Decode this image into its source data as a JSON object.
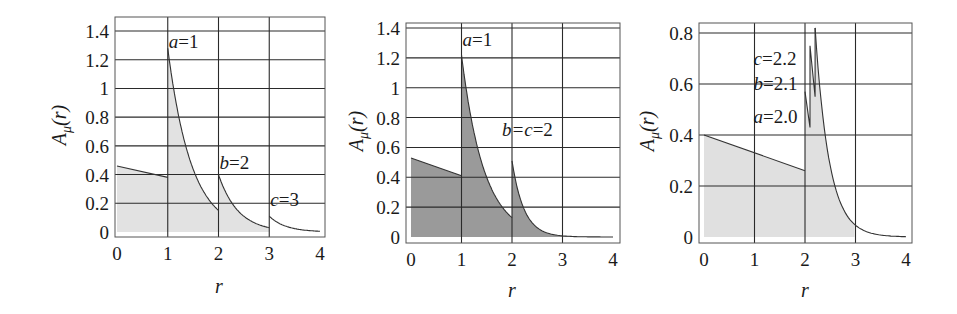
{
  "chart_data": [
    {
      "type": "area",
      "title": "",
      "xlabel": "r",
      "ylabel": "A_μ(r)",
      "ylabel_parts": {
        "base": "A",
        "sub": "μ",
        "arg": "(r)"
      },
      "xlim": [
        0,
        4
      ],
      "ylim": [
        0,
        1.4
      ],
      "xticks": [
        "0",
        "1",
        "2",
        "3",
        "4"
      ],
      "yticks": [
        "0",
        "0.2",
        "0.4",
        "0.6",
        "0.8",
        "1",
        "1.2",
        "1.4"
      ],
      "grid": true,
      "fill_color": "#e2e2e2",
      "fill_until": 3,
      "annotations": [
        {
          "label": "a=1",
          "var": "a",
          "value": "1",
          "x": 1.02,
          "y": 1.32
        },
        {
          "label": "b=2",
          "var": "b",
          "value": "2",
          "x": 2.02,
          "y": 0.48
        },
        {
          "label": "c=3",
          "var": "c",
          "value": "3",
          "x": 3.02,
          "y": 0.22
        }
      ],
      "segments": [
        {
          "x": [
            0,
            1
          ],
          "y": [
            0.46,
            0.38
          ],
          "shape": "linear"
        },
        {
          "x": [
            1,
            2
          ],
          "y": [
            1.28,
            0.15
          ],
          "shape": "decay"
        },
        {
          "x": [
            2,
            3
          ],
          "y": [
            0.4,
            0.03
          ],
          "shape": "decay"
        },
        {
          "x": [
            3,
            4
          ],
          "y": [
            0.11,
            0.005
          ],
          "shape": "decay"
        }
      ]
    },
    {
      "type": "area",
      "title": "",
      "xlabel": "r",
      "ylabel": "A_μ(r)",
      "ylabel_parts": {
        "base": "A",
        "sub": "μ",
        "arg": "(r)"
      },
      "xlim": [
        0,
        4
      ],
      "ylim": [
        0,
        1.4
      ],
      "xticks": [
        "0",
        "1",
        "2",
        "3",
        "4"
      ],
      "yticks": [
        "0",
        "0.2",
        "0.4",
        "0.6",
        "0.8",
        "1",
        "1.2",
        "1.4"
      ],
      "grid": true,
      "fill_color": "#9a9a9a",
      "fill_until": 4,
      "annotations": [
        {
          "label": "a=1",
          "var": "a",
          "value": "1",
          "x": 1.02,
          "y": 1.32
        },
        {
          "label": "b=c=2",
          "var": "b=c",
          "value": "2",
          "x": 1.8,
          "y": 0.72
        }
      ],
      "segments": [
        {
          "x": [
            0,
            1
          ],
          "y": [
            0.53,
            0.41
          ],
          "shape": "linear"
        },
        {
          "x": [
            1,
            2
          ],
          "y": [
            1.22,
            0.13
          ],
          "shape": "decay"
        },
        {
          "x": [
            2,
            4
          ],
          "y": [
            0.51,
            0.0
          ],
          "shape": "fastdecay"
        }
      ]
    },
    {
      "type": "area",
      "title": "",
      "xlabel": "r",
      "ylabel": "A_μ(r)",
      "ylabel_parts": {
        "base": "A",
        "sub": "μ",
        "arg": "(r)"
      },
      "xlim": [
        0,
        4
      ],
      "ylim": [
        0,
        0.8
      ],
      "xticks": [
        "0",
        "1",
        "2",
        "3",
        "4"
      ],
      "yticks": [
        "0",
        "0.2",
        "0.4",
        "0.6",
        "0.8"
      ],
      "grid": true,
      "fill_color": "#e0e0e0",
      "fill_until": 3,
      "annotations": [
        {
          "label": "c=2.2",
          "var": "c",
          "value": "2.2",
          "x": 0.98,
          "y": 0.7
        },
        {
          "label": "b=2.1",
          "var": "b",
          "value": "2.1",
          "x": 0.98,
          "y": 0.6
        },
        {
          "label": "a=2.0",
          "var": "a",
          "value": "2.0",
          "x": 0.98,
          "y": 0.47
        }
      ],
      "segments": [
        {
          "x": [
            0,
            2
          ],
          "y": [
            0.4,
            0.26
          ],
          "shape": "linear"
        },
        {
          "x": [
            2,
            2.1,
            2.1,
            2.2,
            2.2
          ],
          "y": [
            0.57,
            0.43,
            0.75,
            0.55,
            0.82
          ],
          "shape": "points"
        },
        {
          "x": [
            2.2,
            4
          ],
          "y": [
            0.82,
            0.0
          ],
          "shape": "fastdecay2"
        }
      ]
    }
  ]
}
